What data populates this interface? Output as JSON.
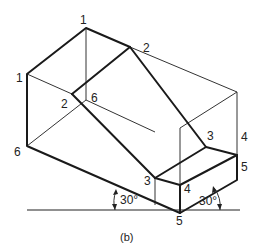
{
  "diagram": {
    "type": "isometric-projection",
    "caption": "(b)",
    "vertex_labels": {
      "back_top": "1",
      "front_top_left": "1",
      "top_right_slope": "2",
      "inner_slope_left": "2",
      "back_bottom": "6",
      "front_bottom_left": "6",
      "step_top_right": "3",
      "step_top_left": "3",
      "step_right_upper": "4",
      "step_front": "4",
      "bottom_right": "5",
      "bottom_front": "5"
    },
    "angles": {
      "left": "30°",
      "right": "30°"
    }
  }
}
